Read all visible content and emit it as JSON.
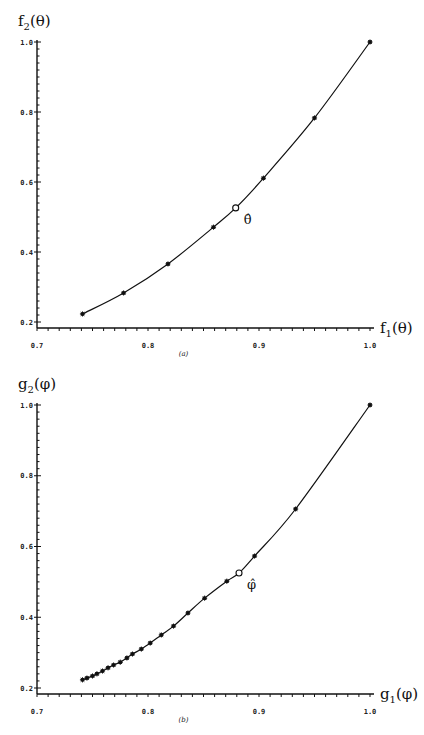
{
  "chart_data": [
    {
      "type": "line",
      "panel": "(a)",
      "title": "",
      "xlabel": "f1(θ)",
      "ylabel": "f2(θ)",
      "xlim": [
        0.7,
        1.0
      ],
      "ylim": [
        0.2,
        1.0
      ],
      "xticks": [
        "0.7",
        "0.8",
        "0.9",
        "1.0"
      ],
      "yticks": [
        "0.2",
        "0.4",
        "0.6",
        "0.8",
        "1.0"
      ],
      "grid": false,
      "series": [
        {
          "name": "curve",
          "marker": "asterisk",
          "x": [
            0.741,
            0.778,
            0.818,
            0.859,
            0.904,
            0.95,
            1.0
          ],
          "y": [
            0.223,
            0.283,
            0.366,
            0.471,
            0.611,
            0.783,
            1.0
          ]
        }
      ],
      "annotations": [
        {
          "label": "θ̂",
          "x": 0.879,
          "y": 0.526,
          "marker": "open-circle"
        }
      ]
    },
    {
      "type": "line",
      "panel": "(b)",
      "title": "",
      "xlabel": "g1(φ)",
      "ylabel": "g2(φ)",
      "xlim": [
        0.7,
        1.0
      ],
      "ylim": [
        0.2,
        1.0
      ],
      "xticks": [
        "0.7",
        "0.8",
        "0.9",
        "1.0"
      ],
      "yticks": [
        "0.2",
        "0.4",
        "0.6",
        "0.8",
        "1.0"
      ],
      "grid": false,
      "series": [
        {
          "name": "curve",
          "marker": "asterisk",
          "x": [
            0.741,
            0.745,
            0.75,
            0.754,
            0.759,
            0.764,
            0.769,
            0.775,
            0.781,
            0.786,
            0.794,
            0.802,
            0.812,
            0.823,
            0.836,
            0.851,
            0.871,
            0.896,
            0.933,
            1.0
          ],
          "y": [
            0.223,
            0.228,
            0.234,
            0.24,
            0.248,
            0.257,
            0.265,
            0.273,
            0.285,
            0.296,
            0.31,
            0.327,
            0.35,
            0.375,
            0.412,
            0.454,
            0.502,
            0.573,
            0.706,
            1.0
          ]
        }
      ],
      "annotations": [
        {
          "label": "φ̂",
          "x": 0.882,
          "y": 0.525,
          "marker": "open-circle"
        }
      ]
    }
  ],
  "panels": {
    "a": {
      "ylabel_main": "f",
      "ylabel_sub": "2",
      "ylabel_arg": "(θ)",
      "xlabel_main": "f",
      "xlabel_sub": "1",
      "xlabel_arg": "(θ)",
      "caption": "(a)",
      "estimate_label": "θ̂"
    },
    "b": {
      "ylabel_main": "g",
      "ylabel_sub": "2",
      "ylabel_arg": "(φ)",
      "xlabel_main": "g",
      "xlabel_sub": "1",
      "xlabel_arg": "(φ)",
      "caption": "(b)",
      "estimate_label": "φ̂"
    }
  }
}
